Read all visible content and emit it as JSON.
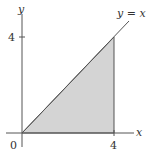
{
  "diagram": {
    "axes": {
      "x_label": "x",
      "y_label": "y",
      "origin_label": "0",
      "x_tick_label": "4",
      "y_tick_label": "4"
    },
    "line_label": "y = x",
    "region": {
      "description": "triangle bounded by y = x, x = 4, y = 0",
      "vertices": [
        [
          0,
          0
        ],
        [
          4,
          0
        ],
        [
          4,
          4
        ]
      ],
      "fill_color": "#d4d4d4"
    },
    "colors": {
      "axis": "#555555",
      "line": "#555555"
    }
  }
}
